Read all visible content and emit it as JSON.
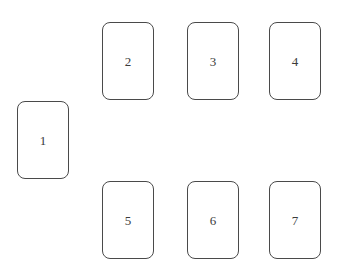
{
  "diagram": {
    "canvas": {
      "width": 345,
      "height": 277,
      "background_color": "#ffffff"
    },
    "card_style": {
      "fill_color": "#ffffff",
      "border_color": "#4a4a4a",
      "border_width_px": 1,
      "corner_radius_px": 8,
      "width_px": 52,
      "height_px": 78,
      "label_color": "#3b3b3b",
      "label_font_size_px": 13
    },
    "cards": [
      {
        "label": "1",
        "x": 17,
        "y": 101,
        "row": "middle-left"
      },
      {
        "label": "2",
        "x": 102,
        "y": 22,
        "row": "top"
      },
      {
        "label": "3",
        "x": 187,
        "y": 22,
        "row": "top"
      },
      {
        "label": "4",
        "x": 269,
        "y": 22,
        "row": "top"
      },
      {
        "label": "5",
        "x": 102,
        "y": 181,
        "row": "bottom"
      },
      {
        "label": "6",
        "x": 187,
        "y": 181,
        "row": "bottom"
      },
      {
        "label": "7",
        "x": 269,
        "y": 181,
        "row": "bottom"
      }
    ]
  }
}
